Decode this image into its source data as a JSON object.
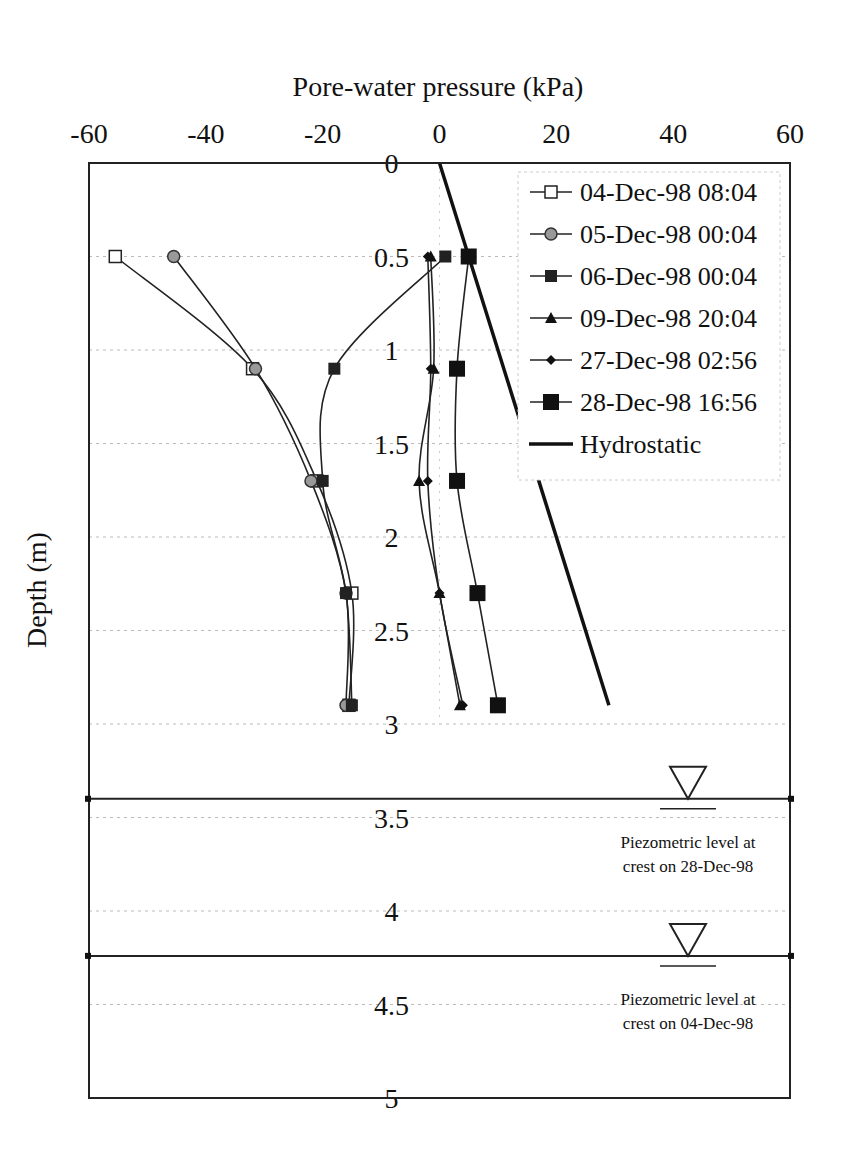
{
  "chart_data": {
    "type": "line",
    "title": "",
    "xlabel": "Pore-water pressure (kPa)",
    "ylabel": "Depth (m)",
    "xlim": [
      -60,
      60
    ],
    "ylim": [
      0,
      5
    ],
    "y_inverted": true,
    "x_axis_position": "top",
    "x_ticks": [
      "-60",
      "-40",
      "-20",
      "0",
      "20",
      "40",
      "60"
    ],
    "y_ticks": [
      "0",
      "0.5",
      "1",
      "1.5",
      "2",
      "2.5",
      "3",
      "3.5",
      "4",
      "4.5",
      "5"
    ],
    "grid": "horizontal dotted",
    "legend_position": "upper right (inside)",
    "depths": [
      0.5,
      1.1,
      1.7,
      2.3,
      2.9
    ],
    "series": [
      {
        "name": "04-Dec-98 08:04",
        "marker": "open-square",
        "values": [
          -55.5,
          -32,
          -21,
          -15,
          -15.5
        ]
      },
      {
        "name": "05-Dec-98 00:04",
        "marker": "gray-circle",
        "values": [
          -45.5,
          -31.5,
          -22,
          -16,
          -16
        ]
      },
      {
        "name": "06-Dec-98 00:04",
        "marker": "small-filled-square",
        "values": [
          1,
          -18,
          -20,
          -16,
          -15
        ]
      },
      {
        "name": "09-Dec-98 20:04",
        "marker": "filled-triangle",
        "values": [
          -1.5,
          -1,
          -3.5,
          0,
          3.5
        ]
      },
      {
        "name": "27-Dec-98 02:56",
        "marker": "filled-diamond",
        "values": [
          -2,
          -1.5,
          -2,
          0,
          4
        ]
      },
      {
        "name": "28-Dec-98 16:56",
        "marker": "large-filled-square",
        "values": [
          5,
          3,
          3,
          6.5,
          10
        ]
      }
    ],
    "hydrostatic": {
      "name": "Hydrostatic",
      "points": [
        [
          0,
          0
        ],
        [
          29,
          2.9
        ]
      ]
    },
    "annotations": [
      {
        "text_lines": [
          "Piezometric level at",
          "crest on 28-Dec-98"
        ],
        "depth": 3.4
      },
      {
        "text_lines": [
          "Piezometric level at",
          "crest on 04-Dec-98"
        ],
        "depth": 4.24
      }
    ]
  },
  "labels": {
    "xlabel": "Pore-water pressure (kPa)",
    "ylabel": "Depth (m)",
    "legend": [
      "04-Dec-98 08:04",
      "05-Dec-98 00:04",
      "06-Dec-98 00:04",
      "09-Dec-98 20:04",
      "27-Dec-98 02:56",
      "28-Dec-98 16:56",
      "Hydrostatic"
    ],
    "piezo1": [
      "Piezometric level at",
      "crest on 28-Dec-98"
    ],
    "piezo2": [
      "Piezometric level at",
      "crest on 04-Dec-98"
    ]
  }
}
